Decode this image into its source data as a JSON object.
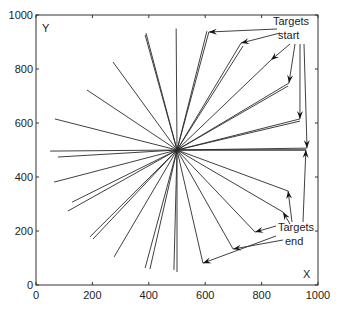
{
  "chart_data": {
    "type": "line",
    "title": "",
    "xlabel": "X",
    "ylabel": "Y",
    "xlim": [
      0,
      1000
    ],
    "ylim": [
      0,
      1000
    ],
    "xticks": [
      0,
      200,
      400,
      600,
      800,
      1000
    ],
    "yticks": [
      0,
      200,
      400,
      600,
      800,
      1000
    ],
    "grid": false,
    "legend": null,
    "center": [
      500,
      500
    ],
    "rays": [
      {
        "from": [
          500,
          500
        ],
        "to": [
          497,
          950
        ]
      },
      {
        "from": [
          500,
          500
        ],
        "to": [
          613,
          937
        ]
      },
      {
        "from": [
          500,
          500
        ],
        "to": [
          606,
          940
        ]
      },
      {
        "from": [
          500,
          500
        ],
        "to": [
          727,
          896
        ]
      },
      {
        "from": [
          500,
          500
        ],
        "to": [
          734,
          885
        ]
      },
      {
        "from": [
          500,
          500
        ],
        "to": [
          833,
          833
        ]
      },
      {
        "from": [
          500,
          500
        ],
        "to": [
          897,
          748
        ]
      },
      {
        "from": [
          500,
          500
        ],
        "to": [
          894,
          737
        ]
      },
      {
        "from": [
          500,
          500
        ],
        "to": [
          936,
          615
        ]
      },
      {
        "from": [
          500,
          500
        ],
        "to": [
          936,
          607
        ]
      },
      {
        "from": [
          500,
          500
        ],
        "to": [
          961,
          507
        ]
      },
      {
        "from": [
          500,
          500
        ],
        "to": [
          957,
          500
        ]
      },
      {
        "from": [
          500,
          500
        ],
        "to": [
          390,
          933
        ]
      },
      {
        "from": [
          500,
          500
        ],
        "to": [
          387,
          926
        ]
      },
      {
        "from": [
          500,
          500
        ],
        "to": [
          273,
          826
        ]
      },
      {
        "from": [
          500,
          500
        ],
        "to": [
          181,
          722
        ]
      },
      {
        "from": [
          500,
          500
        ],
        "to": [
          67,
          615
        ]
      },
      {
        "from": [
          500,
          500
        ],
        "to": [
          50,
          496
        ]
      },
      {
        "from": [
          500,
          500
        ],
        "to": [
          78,
          474
        ]
      },
      {
        "from": [
          500,
          500
        ],
        "to": [
          64,
          381
        ]
      },
      {
        "from": [
          500,
          500
        ],
        "to": [
          128,
          307
        ]
      },
      {
        "from": [
          500,
          500
        ],
        "to": [
          113,
          274
        ]
      },
      {
        "from": [
          500,
          500
        ],
        "to": [
          191,
          178
        ]
      },
      {
        "from": [
          500,
          500
        ],
        "to": [
          202,
          170
        ]
      },
      {
        "from": [
          500,
          500
        ],
        "to": [
          277,
          104
        ]
      },
      {
        "from": [
          500,
          500
        ],
        "to": [
          387,
          63
        ]
      },
      {
        "from": [
          500,
          500
        ],
        "to": [
          404,
          59
        ]
      },
      {
        "from": [
          500,
          500
        ],
        "to": [
          489,
          56
        ]
      },
      {
        "from": [
          500,
          500
        ],
        "to": [
          500,
          48
        ]
      },
      {
        "from": [
          500,
          500
        ],
        "to": [
          592,
          81
        ]
      },
      {
        "from": [
          500,
          500
        ],
        "to": [
          699,
          133
        ]
      },
      {
        "from": [
          500,
          500
        ],
        "to": [
          777,
          196
        ]
      },
      {
        "from": [
          500,
          500
        ],
        "to": [
          876,
          270
        ]
      },
      {
        "from": [
          500,
          500
        ],
        "to": [
          894,
          348
        ]
      },
      {
        "from": [
          500,
          500
        ],
        "to": [
          957,
          500
        ]
      }
    ],
    "annotations": [
      {
        "text": [
          "Targets",
          "start"
        ],
        "position": [
          920,
          960
        ],
        "arrows_to": [
          [
            613,
            937
          ],
          [
            727,
            896
          ],
          [
            833,
            833
          ],
          [
            897,
            748
          ],
          [
            936,
            615
          ],
          [
            961,
            507
          ]
        ]
      },
      {
        "text": [
          "Targets",
          "end"
        ],
        "position": [
          920,
          230
        ],
        "arrows_to": [
          [
            592,
            81
          ],
          [
            699,
            133
          ],
          [
            777,
            196
          ],
          [
            876,
            270
          ],
          [
            894,
            348
          ],
          [
            957,
            500
          ]
        ]
      }
    ]
  },
  "labels": {
    "x_axis_letter": "X",
    "y_axis_letter": "Y",
    "start_line1": "Targets",
    "start_line2": "start",
    "end_line1": "Targets",
    "end_line2": "end"
  },
  "colors": {
    "line": "#2a2a2a",
    "axis": "#333333",
    "text": "#222222",
    "background": "#ffffff"
  }
}
